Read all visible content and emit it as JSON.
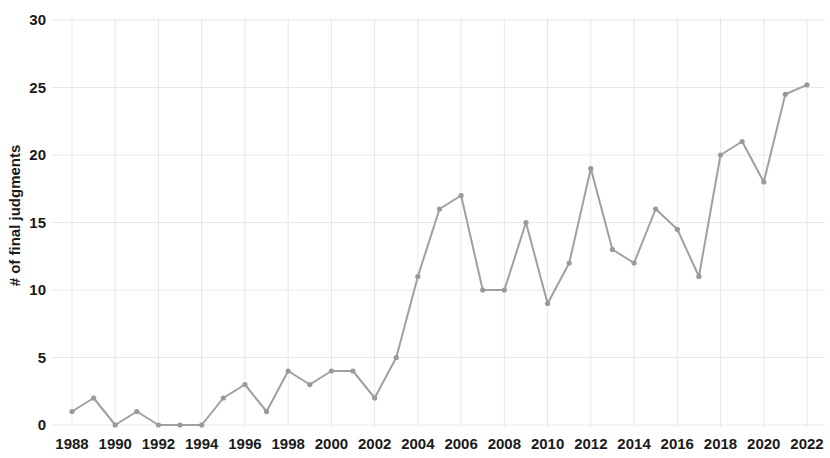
{
  "chart_data": {
    "type": "line",
    "title": "",
    "subtitle": "",
    "xlabel": "",
    "ylabel": "# of final judgments",
    "x": [
      1988,
      1989,
      1990,
      1991,
      1992,
      1993,
      1994,
      1995,
      1996,
      1997,
      1998,
      1999,
      2000,
      2001,
      2002,
      2003,
      2004,
      2005,
      2006,
      2007,
      2008,
      2009,
      2010,
      2011,
      2012,
      2013,
      2014,
      2015,
      2016,
      2017,
      2018,
      2019,
      2020,
      2021,
      2022
    ],
    "values": [
      1,
      2,
      0,
      1,
      0,
      0,
      0,
      2,
      3,
      1,
      4,
      3,
      4,
      4,
      2,
      5,
      11,
      16,
      17,
      10,
      10,
      15,
      9,
      12,
      19,
      13,
      12,
      16,
      14.5,
      11,
      20,
      21,
      18,
      24.5,
      25.2
    ],
    "series": [
      {
        "name": "# of final judgments",
        "values": [
          1,
          2,
          0,
          1,
          0,
          0,
          0,
          2,
          3,
          1,
          4,
          3,
          4,
          4,
          2,
          5,
          11,
          16,
          17,
          10,
          10,
          15,
          9,
          12,
          19,
          13,
          12,
          16,
          14.5,
          11,
          20,
          21,
          18,
          24.5,
          25.2
        ],
        "color": "#a0a0a0"
      }
    ],
    "xlim": [
      1988,
      2022
    ],
    "ylim": [
      0,
      30
    ],
    "ytick_labels": [
      "0",
      "5",
      "10",
      "15",
      "20",
      "25",
      "30"
    ],
    "ytick_values": [
      0,
      5,
      10,
      15,
      20,
      25,
      30
    ],
    "xtick_labels": [
      "1988",
      "1990",
      "1992",
      "1994",
      "1996",
      "1998",
      "2000",
      "2002",
      "2004",
      "2006",
      "2008",
      "2010",
      "2012",
      "2014",
      "2016",
      "2018",
      "2020",
      "2022"
    ],
    "xtick_values": [
      1988,
      1990,
      1992,
      1994,
      1996,
      1998,
      2000,
      2002,
      2004,
      2006,
      2008,
      2010,
      2012,
      2014,
      2016,
      2018,
      2020,
      2022
    ],
    "grid": true,
    "grid_color": "#e8e8e8",
    "legend": false,
    "legend_position": "none",
    "marker": "circle",
    "marker_color": "#9a9a9a",
    "line_color": "#a0a0a0",
    "line_width": 2,
    "background": "#ffffff"
  }
}
